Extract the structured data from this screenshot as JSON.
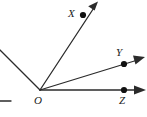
{
  "figure": {
    "type": "geometry-ray-diagram",
    "background_color": "#ffffff",
    "stroke_color": "#2b2b2b",
    "label_color": "#1a1a1a",
    "vertex": {
      "name": "O",
      "label": "O",
      "x": 40,
      "y": 90,
      "label_x": 34,
      "label_y": 95
    },
    "rays": [
      {
        "name": "ray-O-upper-left",
        "label": "",
        "from_x": 40,
        "from_y": 90,
        "to_x": 0,
        "to_y": 50,
        "has_arrowhead": false,
        "has_point_dot": false
      },
      {
        "name": "ray-O-X",
        "label": "X",
        "from_x": 40,
        "from_y": 90,
        "to_x": 97,
        "to_y": 3,
        "has_arrowhead": true,
        "has_point_dot": true,
        "dot_x": 83,
        "dot_y": 15,
        "label_x": 68,
        "label_y": 8
      },
      {
        "name": "ray-O-Y",
        "label": "Y",
        "from_x": 40,
        "from_y": 90,
        "to_x": 144,
        "to_y": 58,
        "has_arrowhead": true,
        "has_point_dot": true,
        "dot_x": 124,
        "dot_y": 64,
        "label_x": 116,
        "label_y": 47
      },
      {
        "name": "ray-O-Z",
        "label": "Z",
        "from_x": 40,
        "from_y": 90,
        "to_x": 145,
        "to_y": 90,
        "has_arrowhead": true,
        "has_point_dot": true,
        "dot_x": 124,
        "dot_y": 90,
        "label_x": 119,
        "label_y": 95
      }
    ],
    "edge_stub": {
      "name": "left-edge-horizontal-stub",
      "from_x": 0,
      "from_y": 101,
      "to_x": 11,
      "to_y": 101
    },
    "points": [
      {
        "name": "point-X",
        "label": "X"
      },
      {
        "name": "point-Y",
        "label": "Y"
      },
      {
        "name": "point-Z",
        "label": "Z"
      },
      {
        "name": "point-O",
        "label": "O"
      }
    ]
  }
}
